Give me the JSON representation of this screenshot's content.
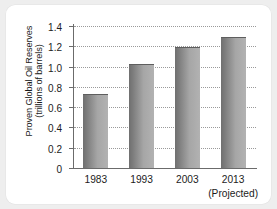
{
  "chart_data": {
    "type": "bar",
    "title": "",
    "subtitle": "",
    "xlabel": "",
    "ylabel_line1": "Proven Global Oil Reserves",
    "ylabel_line2": "(trillions of barrels)",
    "categories": [
      "1983",
      "1993",
      "2003",
      "2013"
    ],
    "category_sublabels": [
      "",
      "",
      "",
      "(Projected)"
    ],
    "values": [
      0.72,
      1.02,
      1.18,
      1.28
    ],
    "series": [
      {
        "name": "Proven Global Oil Reserves",
        "values": [
          0.72,
          1.02,
          1.18,
          1.28
        ]
      }
    ],
    "ylim": [
      0,
      1.4
    ],
    "ytick_values": [
      1.4,
      1.2,
      1.0,
      0.8,
      0.6,
      0.4,
      0.2,
      0
    ],
    "ytick_labels": [
      "1.4",
      "1.2",
      "1.0",
      "0.8",
      "0.6",
      "0.4",
      "0.2",
      "0"
    ],
    "grid": "horizontal-dotted",
    "legend": "none",
    "bar_color": "#8c8c8c",
    "grid_color": "#9a9a9a",
    "axis_color": "#6b6b6b",
    "background_color": "#ffffff",
    "page_background_color": "#eeeeee"
  }
}
